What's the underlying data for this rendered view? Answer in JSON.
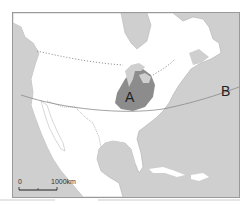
{
  "map": {
    "title": "",
    "labels": {
      "region_a": "A",
      "line_end_b": "B"
    },
    "scale_bar": {
      "start_label": "0",
      "end_label": "1000km"
    },
    "colors": {
      "ocean": "#cfcfcf",
      "land": "#ffffff",
      "region_a": "#8c8c8c",
      "border": "#9a9a9a",
      "line": "#8a8a8a",
      "text": "#222222"
    },
    "features": [
      "dotted-us-canada-border",
      "us-mexico-border",
      "curved-line-a-to-b",
      "shaded-region-a",
      "scale-bar"
    ]
  }
}
